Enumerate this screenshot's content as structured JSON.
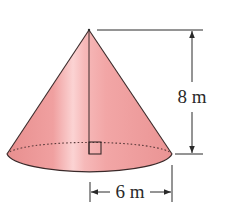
{
  "figure": {
    "type": "right-circular-cone",
    "colors": {
      "fill_main": "#f2a3a3",
      "fill_dark": "#e68a8a",
      "fill_highlight": "#fbd6d6",
      "outline": "#3a2a2a",
      "dimension_lines": "#2a2a2a"
    }
  },
  "labels": {
    "height": "8 m",
    "radius": "6 m"
  },
  "annotations": {
    "right_angle_marker": "right-angle-square",
    "hidden_base_edge": "dotted"
  }
}
